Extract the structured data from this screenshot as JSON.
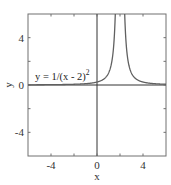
{
  "chart_data": {
    "type": "line",
    "title": "",
    "xlabel": "x",
    "ylabel": "y",
    "xlim": [
      -6,
      6
    ],
    "ylim": [
      -6,
      6
    ],
    "xticks": [
      -4,
      0,
      4
    ],
    "yticks": [
      -4,
      0,
      4
    ],
    "minor_ticks_step": 2,
    "grid": false,
    "legend": null,
    "annotations": [
      {
        "text": "y = 1/(x - 2)",
        "superscript": "2",
        "x": -5.6,
        "y": 0.6
      }
    ],
    "reference_lines": [
      {
        "orientation": "horizontal",
        "value": 0
      },
      {
        "orientation": "vertical",
        "value": 0
      }
    ],
    "series": [
      {
        "name": "y = 1/(x - 2)^2",
        "function": "1/(x-2)^2",
        "asymptote_x": 2,
        "x": [
          -6,
          -4,
          -2,
          -1,
          0,
          0.5,
          1,
          1.5,
          1.6,
          2.4,
          2.5,
          3,
          3.5,
          4,
          5,
          6
        ],
        "values": [
          0.016,
          0.028,
          0.0625,
          0.111,
          0.25,
          0.444,
          1.0,
          4.0,
          6.25,
          6.25,
          4.0,
          1.0,
          0.444,
          0.25,
          0.111,
          0.0625
        ]
      }
    ]
  },
  "labels": {
    "x_axis": "x",
    "y_axis": "y",
    "annotation_main": "y = 1/(x - 2)",
    "annotation_sup": "2",
    "xtick": [
      "-4",
      "0",
      "4"
    ],
    "ytick": [
      "4",
      "0",
      "-4"
    ]
  },
  "colors": {
    "curve": "#555555",
    "axes_box": "#666666",
    "zero_lines": "#333333",
    "text": "#333333"
  }
}
